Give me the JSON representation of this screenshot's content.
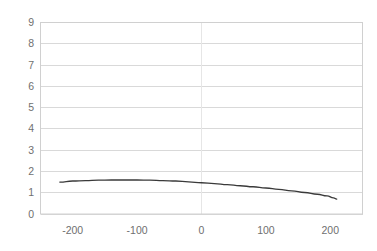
{
  "chart_data": {
    "type": "line",
    "title": "",
    "subtitle": "",
    "xlabel": "",
    "ylabel": "",
    "xlim": [
      -250,
      250
    ],
    "ylim": [
      0,
      9
    ],
    "grid": true,
    "legend": null,
    "legend_position": "none",
    "y_ticks": [
      9,
      8,
      7,
      6,
      5,
      4,
      3,
      2,
      1,
      0
    ],
    "y_tick_labels": [
      "9",
      "8",
      "7",
      "6",
      "5",
      "4",
      "3",
      "2",
      "1",
      "0"
    ],
    "x_ticks": [
      -200,
      -100,
      0,
      100,
      200
    ],
    "x_tick_labels": [
      "-200",
      "-100",
      "0",
      "100",
      "200"
    ],
    "series": [
      {
        "name": "series-1",
        "color": "#3a3a3a",
        "x": [
          -220,
          -200,
          -180,
          -160,
          -140,
          -120,
          -100,
          -80,
          -60,
          -40,
          -20,
          0,
          20,
          40,
          60,
          80,
          100,
          120,
          140,
          160,
          180,
          195,
          205,
          210
        ],
        "values": [
          1.5,
          1.55,
          1.57,
          1.59,
          1.6,
          1.6,
          1.6,
          1.59,
          1.57,
          1.55,
          1.51,
          1.47,
          1.43,
          1.38,
          1.33,
          1.28,
          1.22,
          1.16,
          1.09,
          1.01,
          0.93,
          0.85,
          0.76,
          0.7
        ]
      }
    ],
    "colors": {
      "line": "#3a3a3a",
      "grid": "#d9d9d9",
      "border": "#d0d0d0",
      "tick_text": "#6f6f6f",
      "background": "#ffffff"
    }
  },
  "axes": {
    "y_label_positions": [
      22,
      43.3,
      64.7,
      86.0,
      107.3,
      128.7,
      150.0,
      171.3,
      192.7,
      214
    ],
    "x_label_positions": [
      57,
      129,
      201,
      273,
      345
    ]
  }
}
